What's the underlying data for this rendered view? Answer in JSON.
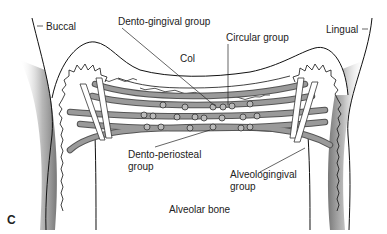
{
  "figure": {
    "panel_label": "C",
    "labels": {
      "buccal": "Buccal",
      "lingual": "Lingual",
      "dento_gingival": "Dento-gingival group",
      "circular": "Circular group",
      "col": "Col",
      "dento_periosteal_1": "Dento-periosteal",
      "dento_periosteal_2": "group",
      "alveologingival_1": "Alveologingival",
      "alveologingival_2": "group",
      "alveolar_bone": "Alveolar bone"
    }
  }
}
